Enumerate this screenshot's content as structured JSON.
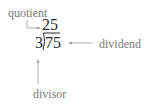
{
  "diagram": {
    "quotient_value": "25",
    "divisor_value": "3",
    "dividend_value": "75",
    "labels": {
      "quotient": "quotient",
      "dividend": "dividend",
      "divisor": "divisor"
    },
    "colors": {
      "label": "#7a7a7a",
      "numbers": "#2a2a2a",
      "arrows": "#9a9a9a"
    }
  }
}
